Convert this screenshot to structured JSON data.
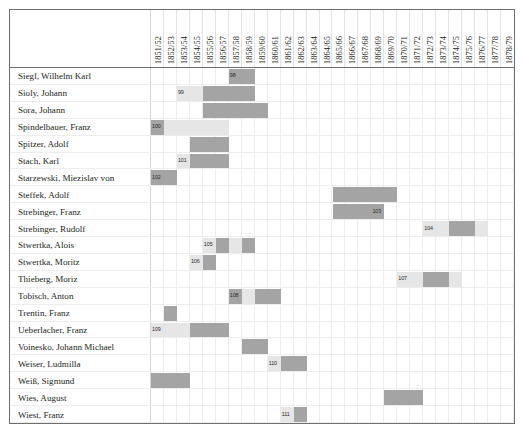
{
  "chart_data": {
    "type": "heatmap",
    "title": "",
    "xlabel": "",
    "ylabel": "",
    "legend": [
      {
        "label": "attested/active",
        "color": "#a4a4a4"
      },
      {
        "label": "probable/inferred",
        "color": "#e6e6e6"
      }
    ],
    "grid": true,
    "categories": [
      "1851/52",
      "1852/53",
      "1853/54",
      "1854/55",
      "1855/56",
      "1856/57",
      "1857/58",
      "1858/59",
      "1859/60",
      "1860/61",
      "1861/62",
      "1862/63",
      "1863/64",
      "1864/65",
      "1865/66",
      "1866/67",
      "1867/68",
      "1868/69",
      "1869/70",
      "1870/71",
      "1871/72",
      "1872/73",
      "1873/74",
      "1874/75",
      "1875/76",
      "1876/77",
      "1877/78",
      "1878/79"
    ],
    "rows": [
      {
        "label": "Siegl, Wilhelm Karl",
        "segments": [
          {
            "start": 6,
            "span": 1,
            "shade": "dark",
            "number": "98"
          },
          {
            "start": 7,
            "span": 1,
            "shade": "dark",
            "number": ""
          }
        ]
      },
      {
        "label": "Sioly, Johann",
        "segments": [
          {
            "start": 2,
            "span": 1,
            "shade": "light",
            "number": "99"
          },
          {
            "start": 3,
            "span": 1,
            "shade": "light",
            "number": ""
          },
          {
            "start": 4,
            "span": 4,
            "shade": "dark",
            "number": ""
          }
        ]
      },
      {
        "label": "Sora, Johann",
        "segments": [
          {
            "start": 4,
            "span": 5,
            "shade": "dark",
            "number": ""
          }
        ]
      },
      {
        "label": "Spindelbauer, Franz",
        "segments": [
          {
            "start": 0,
            "span": 1,
            "shade": "dark",
            "number": "100"
          },
          {
            "start": 1,
            "span": 5,
            "shade": "light",
            "number": ""
          }
        ]
      },
      {
        "label": "Spitzer, Adolf",
        "segments": [
          {
            "start": 3,
            "span": 3,
            "shade": "dark",
            "number": ""
          }
        ]
      },
      {
        "label": "Stach, Karl",
        "segments": [
          {
            "start": 2,
            "span": 1,
            "shade": "light",
            "number": "101"
          },
          {
            "start": 3,
            "span": 3,
            "shade": "dark",
            "number": ""
          }
        ]
      },
      {
        "label": "Starzewski, Miezislav von",
        "segments": [
          {
            "start": 0,
            "span": 1,
            "shade": "dark",
            "number": "102"
          },
          {
            "start": 1,
            "span": 1,
            "shade": "dark",
            "number": ""
          }
        ]
      },
      {
        "label": "Steffek, Adolf",
        "segments": [
          {
            "start": 14,
            "span": 5,
            "shade": "dark",
            "number": ""
          }
        ]
      },
      {
        "label": "Strebinger, Franz",
        "segments": [
          {
            "start": 14,
            "span": 3,
            "shade": "dark",
            "number": ""
          },
          {
            "start": 17,
            "span": 1,
            "shade": "dark",
            "number": "103"
          }
        ]
      },
      {
        "label": "Strebinger, Rudolf",
        "segments": [
          {
            "start": 21,
            "span": 1,
            "shade": "light",
            "number": "104"
          },
          {
            "start": 22,
            "span": 1,
            "shade": "light",
            "number": ""
          },
          {
            "start": 23,
            "span": 2,
            "shade": "dark",
            "number": ""
          },
          {
            "start": 25,
            "span": 1,
            "shade": "light",
            "number": ""
          }
        ]
      },
      {
        "label": "Stwertka, Alois",
        "segments": [
          {
            "start": 4,
            "span": 1,
            "shade": "light",
            "number": "105"
          },
          {
            "start": 5,
            "span": 1,
            "shade": "dark",
            "number": ""
          },
          {
            "start": 6,
            "span": 1,
            "shade": "light",
            "number": ""
          },
          {
            "start": 7,
            "span": 1,
            "shade": "dark",
            "number": ""
          }
        ]
      },
      {
        "label": "Stwertka, Moritz",
        "segments": [
          {
            "start": 3,
            "span": 1,
            "shade": "light",
            "number": "106"
          },
          {
            "start": 4,
            "span": 1,
            "shade": "dark",
            "number": ""
          }
        ]
      },
      {
        "label": "Thieberg, Moriz",
        "segments": [
          {
            "start": 19,
            "span": 1,
            "shade": "light",
            "number": "107"
          },
          {
            "start": 20,
            "span": 1,
            "shade": "light",
            "number": ""
          },
          {
            "start": 21,
            "span": 2,
            "shade": "dark",
            "number": ""
          },
          {
            "start": 23,
            "span": 1,
            "shade": "light",
            "number": ""
          }
        ]
      },
      {
        "label": "Tobisch, Anton",
        "segments": [
          {
            "start": 6,
            "span": 1,
            "shade": "dark",
            "number": "108"
          },
          {
            "start": 7,
            "span": 1,
            "shade": "light",
            "number": ""
          },
          {
            "start": 8,
            "span": 2,
            "shade": "dark",
            "number": ""
          }
        ]
      },
      {
        "label": "Trentin, Franz",
        "segments": [
          {
            "start": 1,
            "span": 1,
            "shade": "dark",
            "number": ""
          }
        ]
      },
      {
        "label": "Ueberlacher, Franz",
        "segments": [
          {
            "start": 0,
            "span": 1,
            "shade": "light",
            "number": "109"
          },
          {
            "start": 1,
            "span": 2,
            "shade": "light",
            "number": ""
          },
          {
            "start": 3,
            "span": 3,
            "shade": "dark",
            "number": ""
          }
        ]
      },
      {
        "label": "Voinesko, Johann Michael",
        "segments": [
          {
            "start": 7,
            "span": 2,
            "shade": "dark",
            "number": ""
          }
        ]
      },
      {
        "label": "Weiser, Ludmilla",
        "segments": [
          {
            "start": 9,
            "span": 1,
            "shade": "light",
            "number": "110"
          },
          {
            "start": 10,
            "span": 2,
            "shade": "dark",
            "number": ""
          }
        ]
      },
      {
        "label": "Weiß, Sigmund",
        "segments": [
          {
            "start": 0,
            "span": 3,
            "shade": "dark",
            "number": ""
          }
        ]
      },
      {
        "label": "Wies, August",
        "segments": [
          {
            "start": 18,
            "span": 3,
            "shade": "dark",
            "number": ""
          }
        ]
      },
      {
        "label": "Wiest, Franz",
        "segments": [
          {
            "start": 10,
            "span": 1,
            "shade": "light",
            "number": "111"
          },
          {
            "start": 11,
            "span": 1,
            "shade": "dark",
            "number": ""
          }
        ]
      }
    ]
  }
}
